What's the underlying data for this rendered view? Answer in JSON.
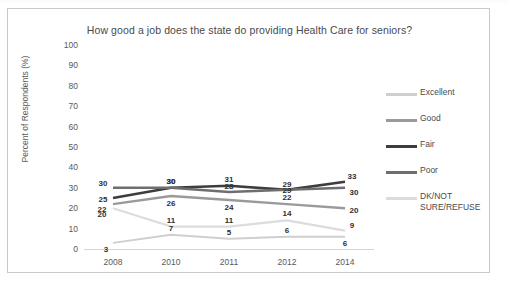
{
  "chart_data": {
    "type": "line",
    "title": "How good a job does the state do providing Health Care for seniors?",
    "xlabel": "",
    "ylabel": "Percent of Respondents (%)",
    "categories": [
      "2008",
      "2010",
      "2011",
      "2012",
      "2014"
    ],
    "ylim": [
      0,
      100
    ],
    "yticks": [
      0,
      10,
      20,
      30,
      40,
      50,
      60,
      70,
      80,
      90,
      100
    ],
    "ytick_labels": [
      "0",
      "10",
      "20",
      "30",
      "40",
      "50",
      "60",
      "70",
      "80",
      "90",
      "100"
    ],
    "grid": false,
    "legend_position": "right",
    "series": [
      {
        "name": "Excellent",
        "color": "#cfcfcf",
        "width": 2,
        "values": [
          3,
          7,
          5,
          6,
          6
        ],
        "labels": [
          "3",
          "7",
          "5",
          "6",
          "6"
        ]
      },
      {
        "name": "Good",
        "color": "#9a9a9a",
        "width": 2.4,
        "values": [
          22,
          26,
          24,
          22,
          20
        ],
        "labels": [
          "22",
          "26",
          "24",
          "22",
          "20"
        ]
      },
      {
        "name": "Fair",
        "color": "#3d3d3d",
        "width": 2.6,
        "values": [
          25,
          30,
          31,
          29,
          33
        ],
        "labels": [
          "25",
          "30",
          "31",
          "29",
          "33"
        ]
      },
      {
        "name": "Poor",
        "color": "#6e6e6e",
        "width": 2.5,
        "values": [
          30,
          30,
          28,
          29,
          30
        ],
        "labels": [
          "30",
          "30",
          "28",
          "29",
          "30"
        ]
      },
      {
        "name": "DK/NOT SURE/REFUSE",
        "color": "#dcdcdc",
        "width": 2.2,
        "values": [
          20,
          11,
          11,
          14,
          9
        ],
        "labels": [
          "20",
          "11",
          "11",
          "14",
          "9"
        ]
      }
    ]
  },
  "legend": {
    "entries": [
      {
        "label": "Excellent",
        "color": "#cfcfcf"
      },
      {
        "label": "Good",
        "color": "#9a9a9a"
      },
      {
        "label": "Fair",
        "color": "#3d3d3d"
      },
      {
        "label": "Poor",
        "color": "#6e6e6e"
      },
      {
        "label": "DK/NOT\nSURE/REFUSE",
        "color": "#dcdcdc"
      }
    ]
  }
}
